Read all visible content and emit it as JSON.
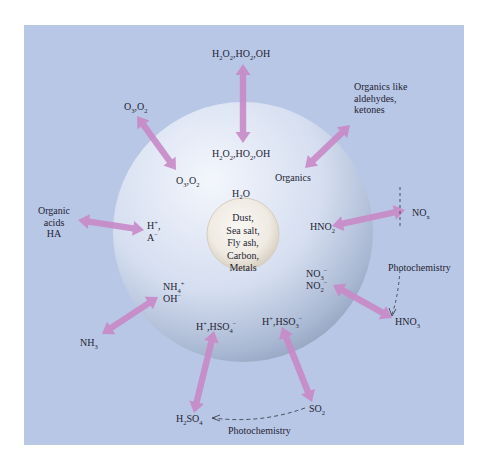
{
  "diagram": {
    "title": "",
    "core": {
      "label_lines": [
        "Dust,",
        "Sea salt,",
        "Fly ash,",
        "Carbon,",
        "Metals"
      ]
    },
    "droplet": {
      "solvent_label": "H₂O"
    },
    "exchanges": [
      {
        "id": "oxidants",
        "gas": "H₂O₂,HO₂,OH",
        "aqueous": "H₂O₂,HO₂,OH",
        "direction": "bidirectional"
      },
      {
        "id": "ozone",
        "gas": "O₃,O₂",
        "aqueous": "O₃,O₂",
        "direction": "bidirectional"
      },
      {
        "id": "organics",
        "gas": "Organics like aldehydes, ketones",
        "aqueous": "Organics",
        "direction": "bidirectional"
      },
      {
        "id": "organic-acids",
        "gas": "Organic acids HA",
        "aqueous": "H⁺, A⁻",
        "direction": "bidirectional"
      },
      {
        "id": "nox",
        "gas": "NOₓ",
        "aqueous": "HNO₂",
        "direction": "bidirectional"
      },
      {
        "id": "hno3",
        "gas": "HNO₃",
        "aqueous": "NO₃⁻ NO₂⁻",
        "direction": "bidirectional"
      },
      {
        "id": "ammonia",
        "gas": "NH₃",
        "aqueous": "NH₄⁺ OH⁻",
        "direction": "bidirectional"
      },
      {
        "id": "sulfuric",
        "gas": "H₂SO₄",
        "aqueous": "H⁺,HSO₄⁻",
        "direction": "bidirectional"
      },
      {
        "id": "so2",
        "gas": "SO₂",
        "aqueous": "H⁺,HSO₃⁻",
        "direction": "bidirectional"
      }
    ],
    "photochemistry_paths": [
      {
        "from": "NOₓ",
        "to": "HNO₃",
        "label": "Photochemistry"
      },
      {
        "from": "SO₂",
        "to": "H₂SO₄",
        "label": "Photochemistry"
      }
    ],
    "colors": {
      "background": "#b9c7e6",
      "droplet_light": "#e9eef8",
      "droplet_dark": "#8d9fbb",
      "arrow": "#c98ac8",
      "core": "#f1ede6",
      "text": "#1e2433"
    }
  }
}
